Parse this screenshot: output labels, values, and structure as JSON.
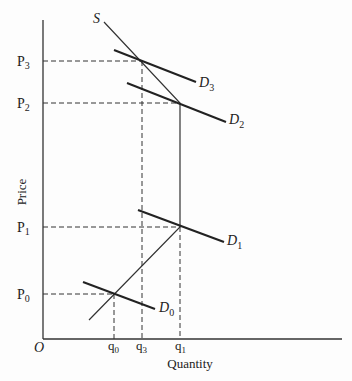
{
  "diagram": {
    "title": "",
    "axes": {
      "x_label": "Quantity",
      "y_label": "Price",
      "origin_label": "O"
    },
    "price_labels": [
      {
        "main": "P",
        "sub": "3"
      },
      {
        "main": "P",
        "sub": "2"
      },
      {
        "main": "P",
        "sub": "1"
      },
      {
        "main": "P",
        "sub": "0"
      }
    ],
    "quantity_labels": [
      {
        "main": "q",
        "sub": "0"
      },
      {
        "main": "q",
        "sub": "3"
      },
      {
        "main": "q",
        "sub": "1"
      }
    ],
    "curves": {
      "supply_label": "S",
      "demand_labels": [
        {
          "main": "D",
          "sub": "3"
        },
        {
          "main": "D",
          "sub": "2"
        },
        {
          "main": "D",
          "sub": "1"
        },
        {
          "main": "D",
          "sub": "0"
        }
      ]
    },
    "equilibria": [
      {
        "price": "P0",
        "quantity": "q0",
        "demand": "D0"
      },
      {
        "price": "P1",
        "quantity": "q1",
        "demand": "D1"
      },
      {
        "price": "P2",
        "quantity": "q1",
        "demand": "D2"
      },
      {
        "price": "P3",
        "quantity": "q3",
        "demand": "D3"
      }
    ]
  }
}
